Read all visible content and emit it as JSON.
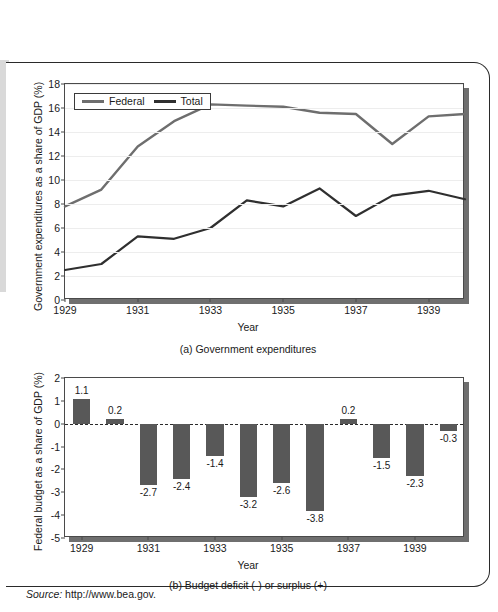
{
  "figure": {
    "source_label": "Source:",
    "source_url": "http://www.bea.gov."
  },
  "chart_data": [
    {
      "type": "line",
      "panel": "(a)",
      "caption": "(a) Government expenditures",
      "title": "",
      "xlabel": "Year",
      "ylabel": "Government expenditures as a share of GDP (%)",
      "x": [
        1929,
        1930,
        1931,
        1932,
        1933,
        1934,
        1935,
        1936,
        1937,
        1938,
        1939,
        1940
      ],
      "xlim": [
        1929,
        1940
      ],
      "ylim": [
        0,
        18
      ],
      "yticks": [
        0,
        2,
        4,
        6,
        8,
        10,
        12,
        14,
        16,
        18
      ],
      "xticks": [
        1929,
        1931,
        1933,
        1935,
        1937,
        1939
      ],
      "grid": true,
      "legend_position": "top-left",
      "series": [
        {
          "name": "Federal",
          "color": "#6e6e6e",
          "values": [
            7.8,
            9.2,
            12.8,
            14.9,
            16.3,
            16.2,
            16.1,
            15.6,
            15.5,
            13.0,
            15.3,
            15.5,
            14.8
          ]
        },
        {
          "name": "Total",
          "color": "#2f2f2f",
          "values": [
            2.5,
            3.0,
            5.3,
            5.1,
            6.0,
            8.3,
            7.8,
            9.3,
            7.0,
            8.7,
            9.1,
            8.4
          ]
        }
      ]
    },
    {
      "type": "bar",
      "panel": "(b)",
      "caption": "(b) Budget deficit (-) or surplus (+)",
      "title": "",
      "xlabel": "Year",
      "ylabel": "Federal budget as a share of GDP (%)",
      "categories": [
        1929,
        1930,
        1931,
        1932,
        1933,
        1934,
        1935,
        1936,
        1937,
        1938,
        1939,
        1940
      ],
      "values": [
        1.1,
        0.2,
        -2.7,
        -2.4,
        -1.4,
        -3.2,
        -2.6,
        -3.8,
        0.2,
        -1.5,
        -2.3,
        -0.3
      ],
      "value_labels": [
        "1.1",
        "0.2",
        "-2.7",
        "-2.4",
        "-1.4",
        "-3.2",
        "-2.6",
        "-3.8",
        "0.2",
        "-1.5",
        "-2.3",
        "-0.3"
      ],
      "ylim": [
        -5,
        2
      ],
      "yticks": [
        2,
        1,
        0,
        -1,
        -2,
        -3,
        -4,
        -5
      ],
      "ytick_labels": [
        "2",
        "1",
        "0",
        "-1",
        "-2",
        "-3",
        "-4",
        "-5"
      ],
      "xticks": [
        1929,
        1931,
        1933,
        1935,
        1937,
        1939
      ],
      "bar_color": "#585858",
      "grid": false
    }
  ]
}
